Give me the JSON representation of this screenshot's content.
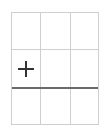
{
  "table_grid_picker": {
    "columns": 3,
    "rows": 3,
    "border_color": "#cfcfcf",
    "divider_color": "#6a6a6a",
    "add_icon": "plus-icon",
    "add_icon_color": "#333333"
  }
}
